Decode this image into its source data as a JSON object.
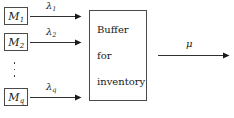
{
  "diagram": {
    "sources": [
      {
        "name": "machine-1",
        "symbol": "M",
        "subscript": "1",
        "rate_symbol": "λ",
        "rate_subscript": "1"
      },
      {
        "name": "machine-2",
        "symbol": "M",
        "subscript": "2",
        "rate_symbol": "λ",
        "rate_subscript": "2"
      },
      {
        "name": "machine-q",
        "symbol": "M",
        "subscript": "q",
        "rate_symbol": "λ",
        "rate_subscript": "q"
      }
    ],
    "ellipsis": "⋮",
    "buffer": {
      "line1": "Buffer",
      "line2": "for",
      "line3": "inventory"
    },
    "output": {
      "rate_symbol": "μ",
      "rate_subscript": ""
    },
    "colors": {
      "stroke": "#4a4a4a",
      "arrow": "#1a1a1a",
      "text": "#1a1a1a",
      "background": "#ffffff"
    }
  }
}
